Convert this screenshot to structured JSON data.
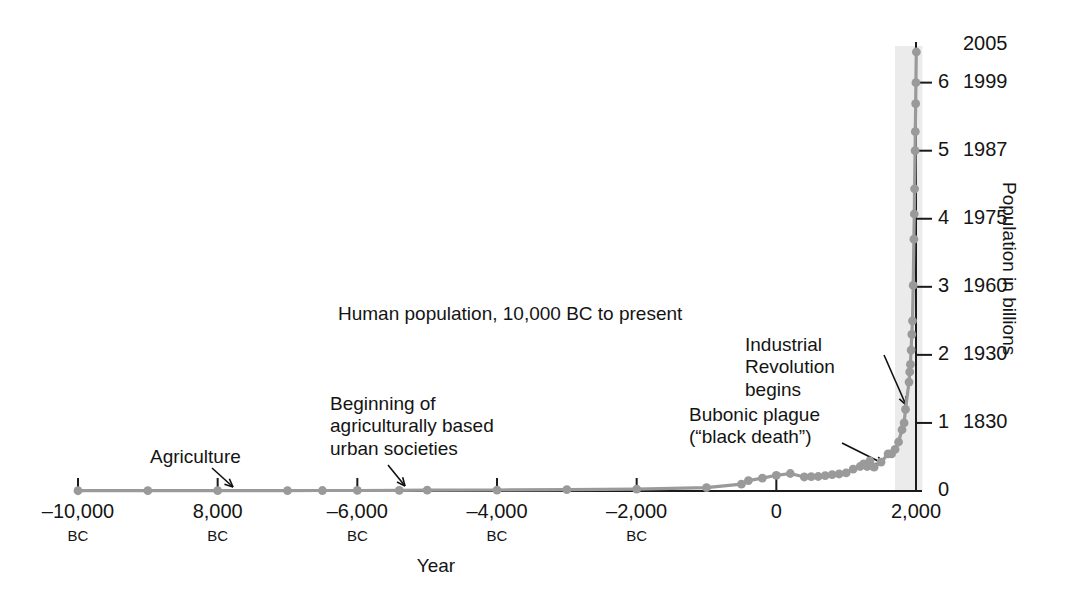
{
  "chart_data": {
    "type": "line",
    "title": "Human population, 10,000 BC to present",
    "xlabel": "Year",
    "ylabel": "Population in billions",
    "xlim": [
      -10000,
      2005
    ],
    "ylim": [
      0,
      6.5
    ],
    "grid": false,
    "legend": "none",
    "x_ticks": [
      {
        "value": -10000,
        "label": "–10,000",
        "sub": "BC"
      },
      {
        "value": -8000,
        "label": "8,000",
        "sub": "BC"
      },
      {
        "value": -6000,
        "label": "–6,000",
        "sub": "BC"
      },
      {
        "value": -4000,
        "label": "–4,000",
        "sub": "BC"
      },
      {
        "value": -2000,
        "label": "–2,000",
        "sub": "BC"
      },
      {
        "value": 0,
        "label": "0",
        "sub": ""
      },
      {
        "value": 2000,
        "label": "2,000",
        "sub": ""
      }
    ],
    "y_ticks": [
      {
        "value": 0,
        "label": "0",
        "year": ""
      },
      {
        "value": 1,
        "label": "1",
        "year": "1830"
      },
      {
        "value": 2,
        "label": "2",
        "year": "1930"
      },
      {
        "value": 3,
        "label": "3",
        "year": "1960"
      },
      {
        "value": 4,
        "label": "4",
        "year": "1975"
      },
      {
        "value": 5,
        "label": "5",
        "year": "1987"
      },
      {
        "value": 6,
        "label": "6",
        "year": "1999"
      }
    ],
    "top_label": "2005",
    "series": [
      {
        "name": "World population",
        "unit": "billions",
        "points": [
          [
            -10000,
            0.004
          ],
          [
            -9000,
            0.005
          ],
          [
            -8000,
            0.005
          ],
          [
            -7000,
            0.006
          ],
          [
            -6500,
            0.007
          ],
          [
            -6000,
            0.008
          ],
          [
            -5400,
            0.01
          ],
          [
            -5000,
            0.012
          ],
          [
            -4000,
            0.014
          ],
          [
            -3000,
            0.02
          ],
          [
            -2000,
            0.027
          ],
          [
            -1000,
            0.05
          ],
          [
            -500,
            0.1
          ],
          [
            -400,
            0.153
          ],
          [
            -200,
            0.19
          ],
          [
            0,
            0.23
          ],
          [
            200,
            0.257
          ],
          [
            400,
            0.206
          ],
          [
            500,
            0.21
          ],
          [
            600,
            0.213
          ],
          [
            700,
            0.226
          ],
          [
            800,
            0.24
          ],
          [
            900,
            0.25
          ],
          [
            1000,
            0.265
          ],
          [
            1100,
            0.32
          ],
          [
            1200,
            0.36
          ],
          [
            1250,
            0.4
          ],
          [
            1300,
            0.36
          ],
          [
            1340,
            0.443
          ],
          [
            1350,
            0.375
          ],
          [
            1400,
            0.35
          ],
          [
            1500,
            0.425
          ],
          [
            1600,
            0.545
          ],
          [
            1650,
            0.545
          ],
          [
            1700,
            0.61
          ],
          [
            1750,
            0.72
          ],
          [
            1800,
            0.9
          ],
          [
            1830,
            1.0
          ],
          [
            1850,
            1.2
          ],
          [
            1900,
            1.6
          ],
          [
            1910,
            1.75
          ],
          [
            1920,
            1.86
          ],
          [
            1930,
            2.07
          ],
          [
            1940,
            2.3
          ],
          [
            1950,
            2.5
          ],
          [
            1960,
            3.02
          ],
          [
            1970,
            3.7
          ],
          [
            1975,
            4.07
          ],
          [
            1980,
            4.44
          ],
          [
            1987,
            5.0
          ],
          [
            1990,
            5.28
          ],
          [
            1995,
            5.69
          ],
          [
            1999,
            6.0
          ],
          [
            2005,
            6.45
          ]
        ]
      }
    ],
    "annotations": [
      {
        "id": "agriculture",
        "text": "Agriculture",
        "x": -8000,
        "y": 0.005
      },
      {
        "id": "urban",
        "text": "Beginning of\nagriculturally based\nurban societies",
        "x": -5400,
        "y": 0.01
      },
      {
        "id": "plague",
        "text": "Bubonic plague\n(“black death”)",
        "x": 1340,
        "y": 0.443
      },
      {
        "id": "industrial",
        "text": "Industrial\nRevolution\nbegins",
        "x": 1830,
        "y": 1.0
      }
    ]
  },
  "colors": {
    "line": "#9a9a9a",
    "marker": "#9a9a9a",
    "axis": "#1a1a1a",
    "text": "#141414",
    "band": "#e8e8e8",
    "background": "#ffffff"
  },
  "annotations": {
    "agriculture": "Agriculture",
    "urban_l1": "Beginning of",
    "urban_l2": "agriculturally based",
    "urban_l3": "urban societies",
    "industrial_l1": "Industrial",
    "industrial_l2": "Revolution",
    "industrial_l3": "begins",
    "plague_l1": "Bubonic plague",
    "plague_l2": "(“black death”)"
  }
}
